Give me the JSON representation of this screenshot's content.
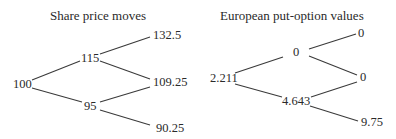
{
  "share_tree": {
    "title": "Share price moves",
    "nodes": {
      "root": "100",
      "up": "115",
      "down": "95",
      "up_up": "132.5",
      "up_down": "109.25",
      "down_down": "90.25"
    }
  },
  "option_tree": {
    "title": "European put-option values",
    "nodes": {
      "root": "2.211",
      "up": "0",
      "down": "4.643",
      "up_up": "0",
      "up_down": "0",
      "down_down": "9.75"
    }
  },
  "colors": {
    "text": "#2a2a2a",
    "lines": "#3a3a3a",
    "background": "#ffffff"
  }
}
